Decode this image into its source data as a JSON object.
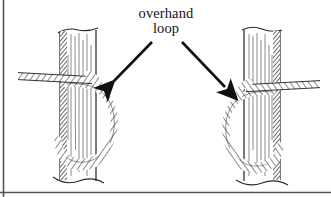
{
  "figure": {
    "domain_kind": "line-drawing-illustration",
    "title_lines": {
      "line1": "overhand",
      "line2": "loop"
    },
    "background_color": "#ffffff",
    "ink_color": "#1a1a1a",
    "border": {
      "left_edge_color": "#555555",
      "bottom_edge_color": "#555555",
      "left_edge_x": 3,
      "bottom_edge_y": 193
    },
    "annotations": [
      {
        "name": "arrow-to-left-knot",
        "direction": "down-left",
        "from_x": 152,
        "from_y": 42,
        "to_x": 113,
        "to_y": 82
      },
      {
        "name": "arrow-to-right-knot",
        "direction": "down-right",
        "from_x": 182,
        "from_y": 42,
        "to_x": 226,
        "to_y": 88
      }
    ],
    "panels": [
      {
        "name": "left-knot-panel",
        "label": "Overhand loop around post, rope entering from left",
        "post": {
          "center_x": 78,
          "top_y": 30,
          "bottom_y": 180,
          "width": 36,
          "shading_side": "left",
          "grain_lines": 7,
          "break_top": true,
          "break_bottom": true
        },
        "rope": {
          "standing_part_side": "left",
          "standing_part_y": 78,
          "loop_bulge_side": "right",
          "loop_top_y": 80,
          "loop_bottom_y": 160
        }
      },
      {
        "name": "right-knot-panel",
        "label": "Overhand loop around post, rope entering from right",
        "post": {
          "center_x": 262,
          "top_y": 30,
          "bottom_y": 180,
          "width": 36,
          "shading_side": "right",
          "grain_lines": 7,
          "break_top": true,
          "break_bottom": true
        },
        "rope": {
          "standing_part_side": "right",
          "standing_part_y": 86,
          "loop_bulge_side": "left",
          "loop_top_y": 90,
          "loop_bottom_y": 165
        }
      }
    ]
  }
}
